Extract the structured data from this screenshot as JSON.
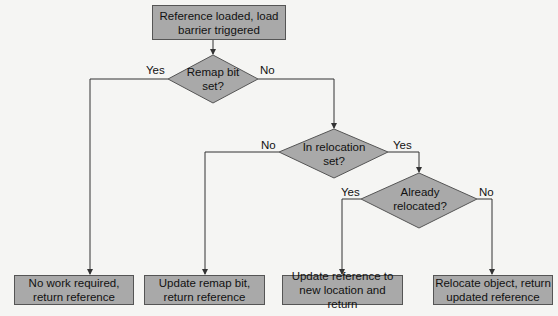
{
  "diagram": {
    "start": {
      "label": "Reference loaded, load barrier triggered"
    },
    "decisions": [
      {
        "id": "remap",
        "label": "Remap bit set?"
      },
      {
        "id": "relocset",
        "label": "In relocation set?"
      },
      {
        "id": "relocated",
        "label": "Already relocated?"
      }
    ],
    "outcomes": [
      {
        "label": "No work required, return reference"
      },
      {
        "label": "Update remap bit, return reference"
      },
      {
        "label": "Update reference to new location and return"
      },
      {
        "label": "Relocate object, return updated reference"
      }
    ],
    "edges": {
      "remap_yes": "Yes",
      "remap_no": "No",
      "relocset_no": "No",
      "relocset_yes": "Yes",
      "relocated_yes": "Yes",
      "relocated_no": "No"
    },
    "colors": {
      "fill": "#a9a9a9",
      "stroke": "#555555",
      "line": "#333333"
    }
  }
}
